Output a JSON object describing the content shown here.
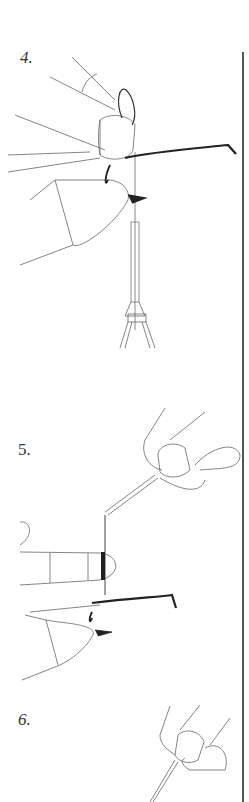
{
  "page": {
    "steps": [
      {
        "number": "4.",
        "description": "fingers holding thread loop over hook shank in vise"
      },
      {
        "number": "5.",
        "description": "thread wrapped around finger while bobbin pulls thread"
      },
      {
        "number": "6.",
        "description": "fingers pinching thread near bobbin tube"
      }
    ]
  },
  "colors": {
    "line": "#555555",
    "ink": "#222222",
    "background": "#ffffff"
  }
}
